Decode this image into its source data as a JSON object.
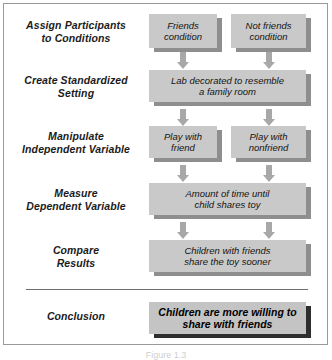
{
  "figure": {
    "caption": "Figure 1.3"
  },
  "rows": [
    {
      "label": "Assign Participants\nto Conditions",
      "label_line1": "Assign Participants",
      "label_line2": "to Conditions",
      "boxes": [
        {
          "line1": "Friends",
          "line2": "condition"
        },
        {
          "line1": "Not friends",
          "line2": "condition"
        }
      ]
    },
    {
      "label_line1": "Create Standardized",
      "label_line2": "Setting",
      "boxes": [
        {
          "line1": "Lab decorated to resemble",
          "line2": "a family room"
        }
      ]
    },
    {
      "label_line1": "Manipulate",
      "label_line2": "Independent Variable",
      "boxes": [
        {
          "line1": "Play with",
          "line2": "friend"
        },
        {
          "line1": "Play with",
          "line2": "nonfriend"
        }
      ]
    },
    {
      "label_line1": "Measure",
      "label_line2": "Dependent Variable",
      "boxes": [
        {
          "line1": "Amount of time until",
          "line2": "child shares toy"
        }
      ]
    },
    {
      "label_line1": "Compare",
      "label_line2": "Results",
      "boxes": [
        {
          "line1": "Children with friends",
          "line2": "share the toy sooner"
        }
      ]
    },
    {
      "label_line1": "Conclusion",
      "label_line2": "",
      "boxes": [
        {
          "line1": "Children are more willing to",
          "line2": "share with friends"
        }
      ]
    }
  ],
  "colors": {
    "box_fill": "#c9c9c9",
    "box_shadow": "#8e8e8e",
    "conclusion_shadow": "#2e2e2e",
    "arrow": "#a8a8a8",
    "frame_border": "#9a9a9a",
    "divider": "#6e6e6e",
    "text": "#141414"
  }
}
